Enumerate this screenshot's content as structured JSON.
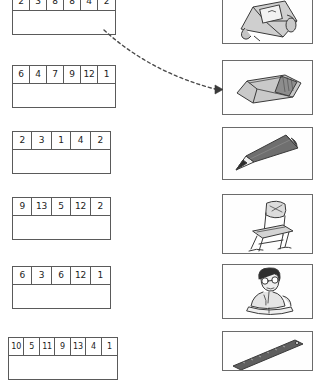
{
  "worksheet": {
    "title": "Number strips matching worksheet",
    "ink_color": "#5a5a5a",
    "text_color": "#1c1c1c"
  },
  "rows": [
    {
      "id": "row-1",
      "numbers": [
        "2",
        "3",
        "8",
        "8",
        "4",
        "2"
      ],
      "answer_value": "",
      "matched_picture": "eraser"
    },
    {
      "id": "row-2",
      "numbers": [
        "6",
        "4",
        "7",
        "9",
        "12",
        "1"
      ],
      "answer_value": "",
      "matched_picture": ""
    },
    {
      "id": "row-3",
      "numbers": [
        "2",
        "3",
        "1",
        "4",
        "2"
      ],
      "answer_value": "",
      "matched_picture": ""
    },
    {
      "id": "row-4",
      "numbers": [
        "9",
        "13",
        "5",
        "12",
        "2"
      ],
      "answer_value": "",
      "matched_picture": ""
    },
    {
      "id": "row-5",
      "numbers": [
        "6",
        "3",
        "6",
        "12",
        "1"
      ],
      "answer_value": "",
      "matched_picture": ""
    },
    {
      "id": "row-6",
      "numbers": [
        "10",
        "5",
        "11",
        "9",
        "13",
        "4",
        "1"
      ],
      "answer_value": "",
      "matched_picture": ""
    }
  ],
  "pictures": [
    {
      "id": "pic-1",
      "name": "backpack",
      "label": "backpack"
    },
    {
      "id": "pic-2",
      "name": "eraser",
      "label": "eraser"
    },
    {
      "id": "pic-3",
      "name": "pencil",
      "label": "pencil"
    },
    {
      "id": "pic-4",
      "name": "chair",
      "label": "chair"
    },
    {
      "id": "pic-5",
      "name": "pupil-reading",
      "label": "pupil"
    },
    {
      "id": "pic-6",
      "name": "ruler",
      "label": "ruler"
    }
  ],
  "connector": {
    "id": "connector-1",
    "style": "dashed-curved-arrow",
    "from": "row-1",
    "to": "pic-2",
    "color": "#4a4a4a"
  }
}
